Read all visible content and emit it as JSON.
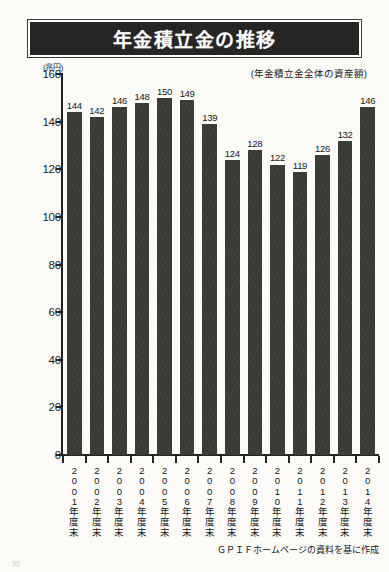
{
  "header": {
    "title": "年金積立金の推移",
    "unit_label": "(兆円)",
    "subtitle": "(年金積立金全体の資産額)"
  },
  "footer": {
    "source_note": "ＧＰＩＦホームページの資料を基に作成",
    "page_number": "33"
  },
  "colors": {
    "bar": "#3b3a37",
    "banner_background": "#262523",
    "banner_text": "#ffffff",
    "axis": "#242422",
    "paper": "#fcfbf8"
  },
  "chart_data": {
    "type": "bar",
    "title": "年金積立金の推移",
    "subtitle": "(年金積立金全体の資産額)",
    "xlabel": "",
    "ylabel": "(兆円)",
    "ylim": [
      0,
      160
    ],
    "yticks": [
      0,
      20,
      40,
      60,
      80,
      100,
      120,
      140,
      160
    ],
    "ytick_labels": [
      "0",
      "20",
      "40",
      "60",
      "80",
      "100",
      "120",
      "140",
      "160"
    ],
    "grid": false,
    "legend": "none",
    "categories": [
      "2001年度末",
      "2002年度末",
      "2003年度末",
      "2004年度末",
      "2005年度末",
      "2006年度末",
      "2007年度末",
      "2008年度末",
      "2009年度末",
      "2010年度末",
      "2011年度末",
      "2012年度末",
      "2013年度末",
      "2014年度末"
    ],
    "category_chars": [
      [
        "2",
        "0",
        "0",
        "1",
        "年",
        "度",
        "末"
      ],
      [
        "2",
        "0",
        "0",
        "2",
        "年",
        "度",
        "末"
      ],
      [
        "2",
        "0",
        "0",
        "3",
        "年",
        "度",
        "末"
      ],
      [
        "2",
        "0",
        "0",
        "4",
        "年",
        "度",
        "末"
      ],
      [
        "2",
        "0",
        "0",
        "5",
        "年",
        "度",
        "末"
      ],
      [
        "2",
        "0",
        "0",
        "6",
        "年",
        "度",
        "末"
      ],
      [
        "2",
        "0",
        "0",
        "7",
        "年",
        "度",
        "末"
      ],
      [
        "2",
        "0",
        "0",
        "8",
        "年",
        "度",
        "末"
      ],
      [
        "2",
        "0",
        "0",
        "9",
        "年",
        "度",
        "末"
      ],
      [
        "2",
        "0",
        "1",
        "0",
        "年",
        "度",
        "末"
      ],
      [
        "2",
        "0",
        "1",
        "1",
        "年",
        "度",
        "末"
      ],
      [
        "2",
        "0",
        "1",
        "2",
        "年",
        "度",
        "末"
      ],
      [
        "2",
        "0",
        "1",
        "3",
        "年",
        "度",
        "末"
      ],
      [
        "2",
        "0",
        "1",
        "4",
        "年",
        "度",
        "末"
      ]
    ],
    "values": [
      144,
      142,
      146,
      148,
      150,
      149,
      139,
      124,
      128,
      122,
      119,
      126,
      132,
      146
    ],
    "value_labels": [
      "144",
      "142",
      "146",
      "148",
      "150",
      "149",
      "139",
      "124",
      "128",
      "122",
      "119",
      "126",
      "132",
      "146"
    ]
  }
}
